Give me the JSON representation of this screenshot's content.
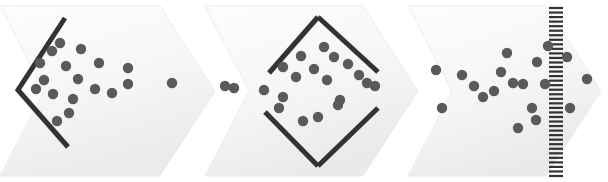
{
  "canvas": {
    "width": 608,
    "height": 182,
    "background": "#ffffff"
  },
  "palette": {
    "dot_fill": "#5a5a5c",
    "stroke_dark": "#333333",
    "panel_light": "#fbfbfb",
    "panel_mid": "#f2f2f2",
    "panel_edge": "#e9e9e9",
    "page_background": "#ffffff"
  },
  "geometry": {
    "dot_radius": 5.2,
    "stroke_width_shape": 5.0,
    "comb_tick_width": 14,
    "comb_tick_height": 2.2,
    "comb_spine_width": 2.0
  },
  "panels": [
    {
      "name": "panel-stage-1",
      "label": "",
      "points": "0,6 160,6 215,91 160,176 0,176 44,91",
      "fill_start": "#fcfcfc",
      "fill_end": "#eeeeee"
    },
    {
      "name": "panel-stage-2",
      "label": "",
      "points": "205,6 363,6 418,91 363,176 205,176 249,91",
      "fill_start": "#fcfcfc",
      "fill_end": "#ededed"
    },
    {
      "name": "panel-stage-3",
      "label": "",
      "points": "408,6 546,6 601,91 546,176 408,176 452,91",
      "fill_start": "#fcfcfc",
      "fill_end": "#ededed"
    }
  ],
  "shapes": {
    "chevron_funnel": {
      "name": "chevron-funnel-shape",
      "label": "",
      "points": "65,18 18,90 68,147"
    },
    "diamond_left_wing": {
      "name": "diamond-upper-left-edge",
      "label": "",
      "points": "272,74 318,18 374,70"
    },
    "diamond_right_wing": {
      "name": "diamond-lower-right-edge",
      "label": "",
      "points": "203,118 318,158"
    },
    "diamond_edges": [
      {
        "name": "diamond-edge-top-left",
        "points": "269,73 318,17"
      },
      {
        "name": "diamond-edge-top-right",
        "points": "318,17 378,72"
      },
      {
        "name": "diamond-edge-bottom-left",
        "points": "265,112 318,166"
      },
      {
        "name": "diamond-edge-bottom-right",
        "points": "318,166 378,108"
      }
    ],
    "comb": {
      "name": "comb-filter-shape",
      "spine_x": 556,
      "top": 8,
      "bottom": 176,
      "tick_count": 38,
      "tick_length": 14
    }
  },
  "dots": {
    "stage_1": [
      [
        60,
        43
      ],
      [
        52,
        51
      ],
      [
        81,
        49
      ],
      [
        40,
        63
      ],
      [
        66,
        66
      ],
      [
        99,
        63
      ],
      [
        44,
        80
      ],
      [
        78,
        79
      ],
      [
        36,
        89
      ],
      [
        53,
        94
      ],
      [
        73,
        99
      ],
      [
        95,
        89
      ],
      [
        112,
        93
      ],
      [
        128,
        84
      ],
      [
        69,
        113
      ],
      [
        57,
        121
      ],
      [
        172,
        83
      ],
      [
        225,
        86
      ],
      [
        128,
        68
      ]
    ],
    "stage_2": [
      [
        324,
        47
      ],
      [
        301,
        56
      ],
      [
        334,
        57
      ],
      [
        283,
        67
      ],
      [
        314,
        69
      ],
      [
        348,
        64
      ],
      [
        296,
        77
      ],
      [
        327,
        80
      ],
      [
        359,
        75
      ],
      [
        367,
        83
      ],
      [
        264,
        90
      ],
      [
        340,
        100
      ],
      [
        283,
        97
      ],
      [
        279,
        108
      ],
      [
        338,
        105
      ],
      [
        303,
        121
      ],
      [
        318,
        117
      ],
      [
        375,
        86
      ],
      [
        234,
        88
      ]
    ],
    "stage_3": [
      [
        436,
        70
      ],
      [
        507,
        53
      ],
      [
        548,
        46
      ],
      [
        462,
        75
      ],
      [
        501,
        72
      ],
      [
        537,
        62
      ],
      [
        523,
        84
      ],
      [
        545,
        84
      ],
      [
        474,
        86
      ],
      [
        494,
        91
      ],
      [
        483,
        97
      ],
      [
        513,
        83
      ],
      [
        532,
        108
      ],
      [
        442,
        108
      ],
      [
        536,
        120
      ],
      [
        518,
        128
      ],
      [
        567,
        57
      ],
      [
        587,
        79
      ],
      [
        570,
        108
      ]
    ]
  }
}
